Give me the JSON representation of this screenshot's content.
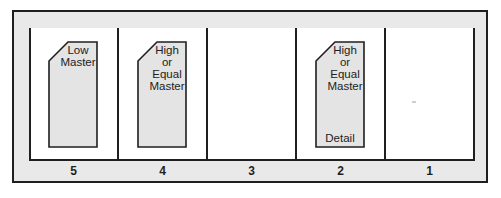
{
  "diagram": {
    "colors": {
      "frame_fill": "#e9e9e9",
      "line": "#1f1f1f",
      "card_fill": "#e4e4e4",
      "pocket_fill": "#ffffff"
    },
    "pockets": [
      {
        "label": "5",
        "card": {
          "lines": [
            "Low",
            "Master"
          ],
          "bottom": ""
        }
      },
      {
        "label": "4",
        "card": {
          "lines": [
            "High",
            "or",
            "Equal",
            "Master"
          ],
          "bottom": ""
        }
      },
      {
        "label": "3",
        "card": null
      },
      {
        "label": "2",
        "card": {
          "lines": [
            "High",
            "or",
            "Equal",
            "Master"
          ],
          "bottom": "Detail"
        }
      },
      {
        "label": "1",
        "card": null
      }
    ]
  }
}
